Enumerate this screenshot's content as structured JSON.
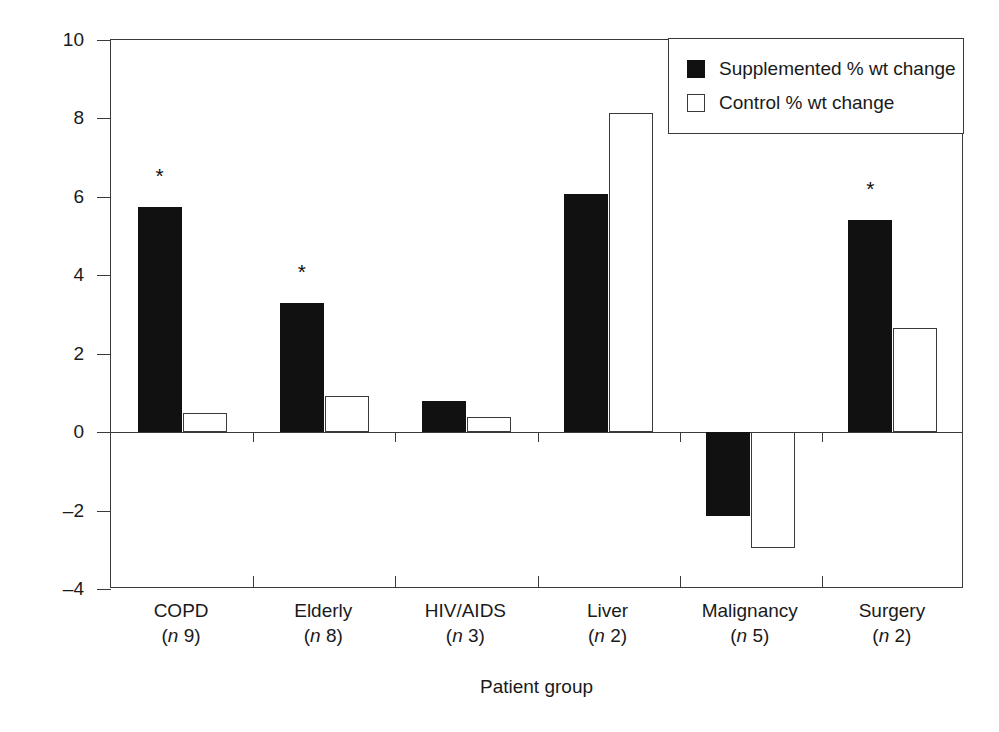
{
  "chart_data": {
    "type": "bar",
    "title": "",
    "xlabel": "Patient group",
    "ylabel": "Weight change (%)",
    "ylim": [
      -4,
      10
    ],
    "yticks": [
      10,
      8,
      6,
      4,
      2,
      0,
      -2,
      -4
    ],
    "ytick_labels": [
      "10",
      "8",
      "6",
      "4",
      "2",
      "0",
      "–2",
      "–4"
    ],
    "grid": false,
    "legend_position": "top-right",
    "categories": [
      "COPD",
      "Elderly",
      "HIV/AIDS",
      "Liver",
      "Malignancy",
      "Surgery"
    ],
    "category_n": [
      "(n 9)",
      "(n 8)",
      "(n 3)",
      "(n 2)",
      "(n 5)",
      "(n 2)"
    ],
    "series": [
      {
        "name": "Supplemented % wt change",
        "color": "#111111",
        "values": [
          5.75,
          3.3,
          0.8,
          6.07,
          -2.15,
          5.4
        ]
      },
      {
        "name": "Control % wt change",
        "color": "#ffffff",
        "values": [
          0.5,
          0.93,
          0.38,
          8.15,
          -2.95,
          2.65
        ]
      }
    ],
    "annotations": [
      {
        "category": "COPD",
        "symbol": "*",
        "meaning": "significant"
      },
      {
        "category": "Elderly",
        "symbol": "*",
        "meaning": "significant"
      },
      {
        "category": "Surgery",
        "symbol": "*",
        "meaning": "significant"
      }
    ]
  },
  "legend": {
    "items": [
      {
        "label": "Supplemented % wt change",
        "swatch": "filled-square"
      },
      {
        "label": "Control % wt change",
        "swatch": "hollow-square"
      }
    ]
  },
  "axes": {
    "y_title": "Weight change (%)",
    "x_title": "Patient group",
    "ytick_labels": [
      "10",
      "8",
      "6",
      "4",
      "2",
      "0",
      "–2",
      "–4"
    ]
  },
  "groups": [
    {
      "name": "COPD",
      "n": "(n 9)",
      "star": "*"
    },
    {
      "name": "Elderly",
      "n": "(n 8)",
      "star": "*"
    },
    {
      "name": "HIV/AIDS",
      "n": "(n 3)",
      "star": ""
    },
    {
      "name": "Liver",
      "n": "(n 2)",
      "star": ""
    },
    {
      "name": "Malignancy",
      "n": "(n 5)",
      "star": ""
    },
    {
      "name": "Surgery",
      "n": "(n 2)",
      "star": "*"
    }
  ],
  "colors": {
    "supplemented": "#111111",
    "control": "#ffffff",
    "axis": "#3a3a3a",
    "background": "#ffffff"
  }
}
